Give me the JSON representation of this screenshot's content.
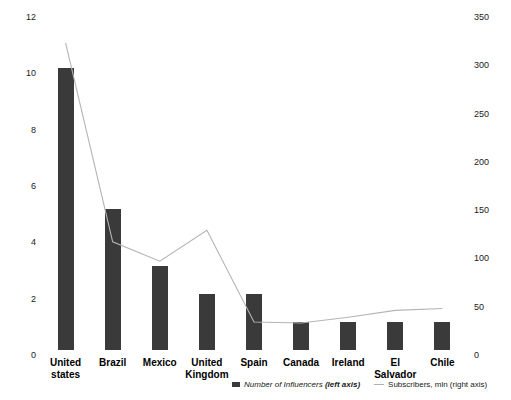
{
  "chart_data": {
    "type": "bar",
    "title": "",
    "subtitle": "",
    "xlabel": "",
    "ylabel": "",
    "grid": false,
    "legend_position": "bottom",
    "categories": [
      "United states",
      "Brazil",
      "Mexico",
      "United Kingdom",
      "Spain",
      "Canada",
      "Ireland",
      "El Salvador",
      "Chile"
    ],
    "series": [
      {
        "name": "Number of Influencers (left axis)",
        "type": "bar",
        "axis": "left",
        "color": "#3a3a3a",
        "values": [
          10,
          5,
          3,
          2,
          2,
          1,
          1,
          1,
          1
        ]
      },
      {
        "name": "Subscribers, mln (right axis)",
        "type": "line",
        "axis": "right",
        "color": "#b4b4b4",
        "values": [
          318,
          112,
          92,
          124,
          29,
          28,
          34,
          41,
          43
        ]
      }
    ],
    "left_axis": {
      "ticks": [
        "0",
        "2",
        "4",
        "6",
        "8",
        "10",
        "12"
      ],
      "min": 0,
      "max": 12
    },
    "right_axis": {
      "ticks": [
        "0",
        "50",
        "100",
        "150",
        "200",
        "250",
        "300",
        "350"
      ],
      "min": 0,
      "max": 350
    }
  },
  "legend": {
    "bar_entry": {
      "text_main": "Number of Influencers ",
      "text_emphasis": "(left axis)"
    },
    "line_entry": {
      "text": "Subscribers, mln (right axis)"
    }
  }
}
